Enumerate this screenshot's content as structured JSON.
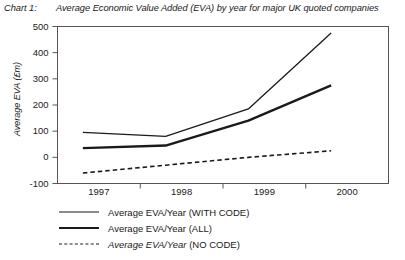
{
  "caption": {
    "label": "Chart 1:",
    "text": "Average Economic Value Added (EVA) by year for major UK quoted companies"
  },
  "chart_data": {
    "type": "line",
    "title": "Average Economic Value Added (EVA) by year for major UK quoted companies",
    "xlabel": "",
    "ylabel": "Average EVA (£m)",
    "categories": [
      "1997",
      "1998",
      "1999",
      "2000"
    ],
    "ylim": [
      -100,
      500
    ],
    "yticks": [
      500,
      400,
      300,
      200,
      100,
      0,
      -100
    ],
    "ytick_labels": [
      "500",
      "400",
      "300",
      "200",
      "100",
      "0",
      "-100"
    ],
    "grid": false,
    "legend_position": "below",
    "series": [
      {
        "name": "Average EVA/Year (WITH CODE)",
        "style": "solid-thin",
        "values": [
          95,
          80,
          185,
          475
        ]
      },
      {
        "name": "Average EVA/Year (ALL)",
        "style": "solid-thick",
        "values": [
          35,
          45,
          140,
          275
        ]
      },
      {
        "name": "Average EVA/Year (NO CODE)",
        "style": "dashed",
        "values": [
          -60,
          -30,
          0,
          25
        ]
      }
    ]
  },
  "legend": [
    {
      "style": "thin",
      "label": "Average EVA/Year (WITH CODE)",
      "italic": false
    },
    {
      "style": "thick",
      "label": "Average EVA/Year (ALL)",
      "italic": false
    },
    {
      "style": "dash",
      "label_italic_part": "Average EVA/Year",
      "label_plain_part": " (NO CODE)",
      "italic": true
    }
  ],
  "colors": {
    "line": "#1a1a1a",
    "axis": "#555555",
    "background": "#ffffff"
  }
}
